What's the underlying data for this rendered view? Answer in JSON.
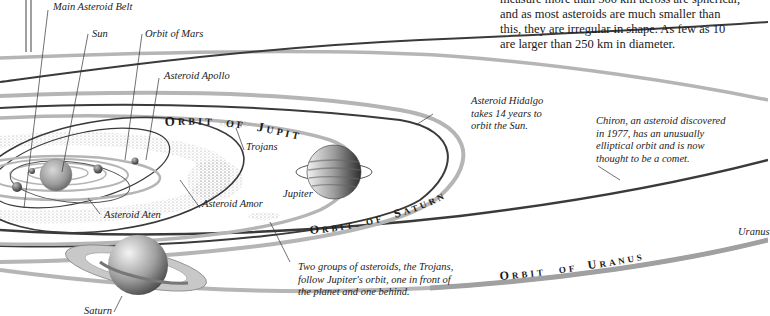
{
  "intro_text": {
    "lines": [
      "measure more than 300 km across are spherical,",
      "and as most asteroids are much smaller than",
      "this, they are irregular in shape. As few as 10",
      "are larger than 250 km in diameter."
    ]
  },
  "labels": {
    "main_belt": "Main Asteroid Belt",
    "sun": "Sun",
    "orbit_mars": "Orbit of Mars",
    "apollo": "Asteroid Apollo",
    "trojans": "Trojans",
    "jupiter": "Jupiter",
    "aten": "Asteroid Aten",
    "amor": "Asteroid Amor",
    "saturn": "Saturn",
    "uranus": "Uranus"
  },
  "orbit_titles": {
    "jupiter": "ORBIT OF JUPITER",
    "saturn": "ORBIT OF SATURN",
    "uranus": "ORBIT OF URANUS"
  },
  "notes": {
    "hidalgo": [
      "Asteroid Hidalgo",
      "takes 14 years to",
      "orbit the Sun."
    ],
    "chiron": [
      "Chiron, an asteroid discovered",
      "in 1977, has an unusually",
      "elliptical orbit and is now",
      "thought to be a comet."
    ],
    "trojans": [
      "Two groups of asteroids, the Trojans,",
      "follow Jupiter's orbit, one in front of",
      "the planet and one behind."
    ]
  },
  "colors": {
    "orbit_dark": "#3a3a3a",
    "orbit_light": "#b5b5b5",
    "asteroid_dots": "#8a8a8a",
    "leader_line": "#333333"
  }
}
